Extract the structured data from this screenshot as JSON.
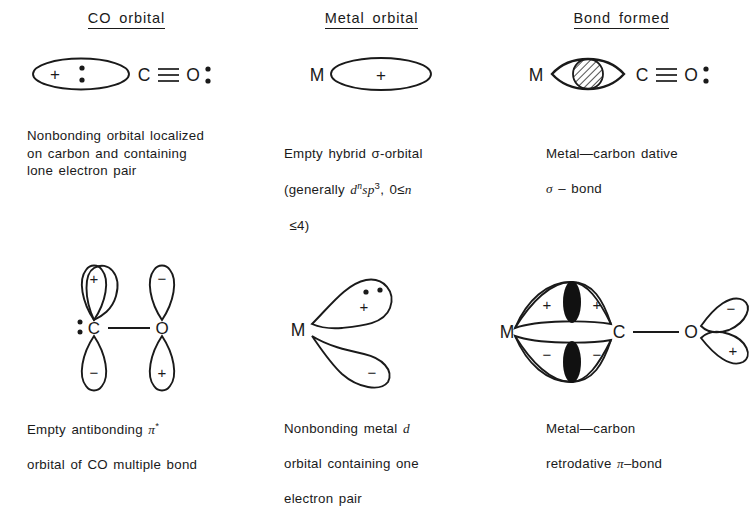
{
  "figure": {
    "title_implicit": "Bonding of CO to a metal center",
    "columns": [
      {
        "id": "co-orbital",
        "header": "CO  orbital",
        "diagram": {
          "name": "co-sigma-donor-orbital",
          "labels": [
            "+",
            "C",
            "O"
          ],
          "bond": "triple",
          "lone_pairs": 2,
          "description": "Ellipse lobe bearing a plus sign and a lone pair, attached to C of C≡O with a lone pair on O"
        },
        "caption": "Nonbonding orbital localized\non carbon and containing\nlone electron pair"
      },
      {
        "id": "metal-orbital",
        "header": "Metal  orbital",
        "diagram": {
          "name": "metal-hybrid-sigma-orbital",
          "labels": [
            "M",
            "+"
          ],
          "description": "Metal atom M with an empty elliptical hybrid sigma orbital marked +"
        },
        "caption_parts": {
          "line1_pre": "Empty hybrid ",
          "sigma": "σ",
          "line1_post": "-orbital",
          "line2_pre": "(generally ",
          "d": "d",
          "n": "n",
          "sp": "sp",
          "three": "3",
          "line2_mid": ", 0≤",
          "n2": "n",
          "line3": " ≤4)"
        },
        "caption": "Empty hybrid σ-orbital\n(generally dⁿsp³, 0≤n\n ≤4)"
      },
      {
        "id": "bond-formed",
        "header": "Bond formed",
        "diagram": {
          "name": "metal-carbon-dative-sigma-bond",
          "labels": [
            "M",
            "C",
            "O"
          ],
          "bond": "triple",
          "overlap": "hatched",
          "description": "M joined by a lens-shaped overlap region (hatched) to C≡O with lone pair on O"
        },
        "caption": "Metal—carbon dative\nσ – bond"
      },
      {
        "id": "co-pi-star",
        "header": "",
        "diagram": {
          "name": "co-pi-antibonding-orbital",
          "labels": [
            "C",
            "O"
          ],
          "lobe_signs_top": [
            "+",
            "−"
          ],
          "lobe_signs_bottom": [
            "−",
            "+"
          ],
          "description": "C—O with vertical teardrop p-orbital lobes above and below each atom"
        },
        "caption": "Empty antibonding π*\northbital of CO multiple bond"
      },
      {
        "id": "metal-d-orbital",
        "header": "",
        "diagram": {
          "name": "metal-d-orbital-filled",
          "labels": [
            "M"
          ],
          "lobe_signs": [
            "+",
            "−"
          ],
          "electron_pair_dots": 2,
          "description": "Metal atom M with two angled teardrop d lobes, upper marked + with an electron pair, lower marked −"
        },
        "caption": "Nonbonding metal d\northbital containing one\nelectron pair"
      },
      {
        "id": "retrodative-pi-bond",
        "header": "",
        "diagram": {
          "name": "metal-carbon-retrodative-pi-bond",
          "labels": [
            "M",
            "C",
            "O"
          ],
          "lobe_signs_upper": [
            "+",
            "+"
          ],
          "lobe_signs_lower": [
            "−",
            "−"
          ],
          "oxygen_lobe_signs": [
            "−",
            "+"
          ],
          "overlap": "filled-black",
          "description": "M and C joined by upper and lower overlapping lobe pairs with filled black overlap regions; O carries two angled lobes"
        },
        "caption": "Metal—carbon\nretrodative π–bond"
      }
    ],
    "captions": {
      "co_orbital": "Nonbonding orbital localized\non carbon and containing\nlone electron pair",
      "metal_orbital_l1": "Empty hybrid σ-orbital",
      "metal_orbital_l2a": "(generally ",
      "metal_orbital_l2b": ", 0≤",
      "metal_orbital_l3": "≤4)",
      "bond_formed_l1": "Metal—carbon dative",
      "bond_formed_l2": " – bond",
      "pi_star_l1a": "Empty antibonding ",
      "pi_star_l1b": "*",
      "pi_star_l2": "orbital of CO multiple bond",
      "metal_d_l1a": "Nonbonding metal ",
      "metal_d_l2": "orbital containing one",
      "metal_d_l3": "electron pair",
      "retro_l1": "Metal—carbon",
      "retro_l2a": "retrodative ",
      "retro_l2b": "–bond"
    },
    "glyphs": {
      "sigma": "σ",
      "pi": "π",
      "d": "d",
      "n": "n",
      "sp": "sp",
      "exp3": "3",
      "plus": "+",
      "minus": "−",
      "M": "M",
      "C": "C",
      "O": "O"
    },
    "colors": {
      "ink": "#1a1a1a",
      "background": "#ffffff",
      "fill_black": "#111111"
    }
  }
}
